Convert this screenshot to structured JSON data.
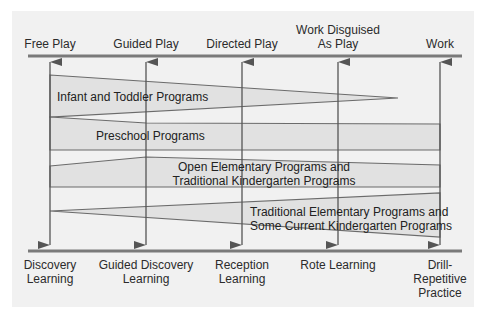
{
  "top_labels": [
    {
      "text": "Free Play",
      "x": 50
    },
    {
      "text": "Guided Play",
      "x": 146
    },
    {
      "text": "Directed Play",
      "x": 242
    },
    {
      "line1": "Work Disguised",
      "line2": "As Play",
      "x": 338
    },
    {
      "text": "Work",
      "x": 440
    }
  ],
  "bottom_labels": [
    {
      "line1": "Discovery",
      "line2": "Learning"
    },
    {
      "line1": "Guided Discovery",
      "line2": "Learning"
    },
    {
      "line1": "Reception",
      "line2": "Learning"
    },
    {
      "line1": "Rote Learning"
    },
    {
      "line1": "Drill-",
      "line2": "Repetitive",
      "line3": "Practice"
    }
  ],
  "bands": [
    {
      "label": "Infant and Toddler Programs"
    },
    {
      "label": "Preschool Programs"
    },
    {
      "line1": "Open Elementary Programs and",
      "line2": "Traditional Kindergarten Programs"
    },
    {
      "line1": "Traditional Elementary Programs and",
      "line2": "Some Current Kindergarten Programs"
    }
  ],
  "colors": {
    "panel": "#f1f1f1",
    "band_fill": "#e1e1e1",
    "line": "#6b6b6b",
    "axis": "#7a7a7a"
  }
}
